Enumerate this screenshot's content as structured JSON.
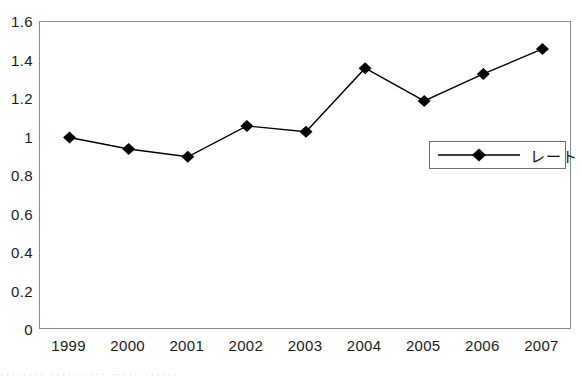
{
  "chart_data": {
    "type": "line",
    "title": "",
    "subtitle": "",
    "xlabel": "",
    "ylabel": "",
    "categories": [
      "1999",
      "2000",
      "2001",
      "2002",
      "2003",
      "2004",
      "2005",
      "2006",
      "2007"
    ],
    "series": [
      {
        "name": "レート",
        "marker": "filled-diamond",
        "color": "#000000",
        "values": [
          1.0,
          0.94,
          0.9,
          1.06,
          1.03,
          1.36,
          1.19,
          1.33,
          1.46
        ]
      }
    ],
    "ylim": [
      0,
      1.6
    ],
    "ytick_labels": [
      "1.6",
      "1.4",
      "1.2",
      "1",
      "0.8",
      "0.6",
      "0.4",
      "0.2",
      "0"
    ],
    "ytick_values": [
      1.6,
      1.4,
      1.2,
      1.0,
      0.8,
      0.6,
      0.4,
      0.2,
      0.0
    ],
    "grid": false,
    "legend_position": "inside-right",
    "plot_border_color": "#8a8a8a",
    "line_color": "#000000",
    "background": "#ffffff"
  },
  "legend": {
    "entries": [
      {
        "label": "レート"
      }
    ]
  },
  "artifact": {
    "text": "········    ·····    ····    ·····  ······"
  }
}
